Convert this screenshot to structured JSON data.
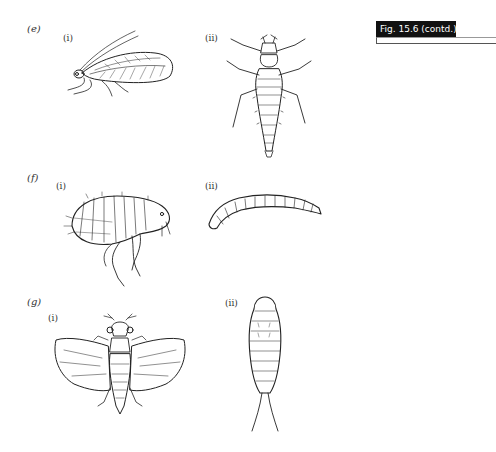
{
  "figure": {
    "tag": "Fig. 15.6  (contd.)"
  },
  "parts": [
    {
      "label": "(e)",
      "items": [
        {
          "label": "(i)",
          "subject": "adult lacewing (side view)"
        },
        {
          "label": "(ii)",
          "subject": "lacewing larva (dorsal view)"
        }
      ]
    },
    {
      "label": "(f)",
      "items": [
        {
          "label": "(i)",
          "subject": "adult flea (side view)"
        },
        {
          "label": "(ii)",
          "subject": "flea larva"
        }
      ]
    },
    {
      "label": "(g)",
      "items": [
        {
          "label": "(i)",
          "subject": "adult winged insect (dorsal view)"
        },
        {
          "label": "(ii)",
          "subject": "nymph with cerci (dorsal view)"
        }
      ]
    }
  ]
}
